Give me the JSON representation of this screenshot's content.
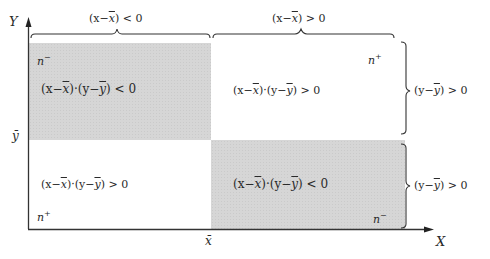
{
  "diagram": {
    "axes": {
      "y_label": "Y",
      "x_label": "X",
      "y_mean_label": "ȳ",
      "x_mean_label": "x̄"
    },
    "top_braces": [
      {
        "label_pre": "(x−",
        "mean": "x",
        "label_post": ") < 0"
      },
      {
        "label_pre": "(x−",
        "mean": "x",
        "label_post": ") > 0"
      }
    ],
    "right_braces": [
      {
        "label_pre": "(y−",
        "mean": "y",
        "label_post": ") > 0"
      },
      {
        "label_pre": "(y−",
        "mean": "y",
        "label_post": ") > 0"
      }
    ],
    "quadrants": {
      "top_left": {
        "count": "n",
        "sign": "−",
        "expr_a": "(x−",
        "expr_b": ")·(y−",
        "expr_c": ") < 0",
        "shaded": true
      },
      "top_right": {
        "count": "n",
        "sign": "+",
        "expr_a": "(x−",
        "expr_b": ")·(y−",
        "expr_c": ") > 0",
        "shaded": false
      },
      "bottom_left": {
        "count": "n",
        "sign": "+",
        "expr_a": "(x−",
        "expr_b": ")·(y−",
        "expr_c": ") > 0",
        "shaded": false
      },
      "bottom_right": {
        "count": "n",
        "sign": "−",
        "expr_a": "(x−",
        "expr_b": ")·(y−",
        "expr_c": ") < 0",
        "shaded": true
      }
    },
    "colors": {
      "shade": "#d6d6d6",
      "line": "#333333"
    }
  }
}
